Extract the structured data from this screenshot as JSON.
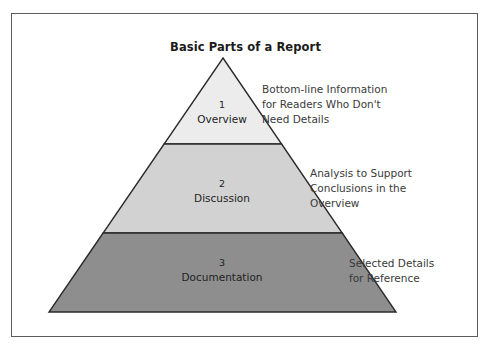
{
  "figure": {
    "title": "Basic Parts of a Report",
    "border_color": "#5c5c5c",
    "background_color": "#ffffff"
  },
  "chart_data": {
    "type": "pyramid",
    "title": "Basic Parts of a Report",
    "levels": [
      {
        "number": "1",
        "name": "Overview",
        "fill": "#ececec",
        "callout": "Bottom-line Information\nfor Readers Who Don't\nNeed Details"
      },
      {
        "number": "2",
        "name": "Discussion",
        "fill": "#d2d2d2",
        "callout": "Analysis to Support\nConclusions in the\nOverview"
      },
      {
        "number": "3",
        "name": "Documentation",
        "fill": "#8e8e8e",
        "callout": "Selected Details\nfor Reference"
      }
    ],
    "geometry": {
      "apex": [
        211,
        44
      ],
      "base_left": [
        37,
        298
      ],
      "base_right": [
        384,
        298
      ],
      "divider_y": [
        130,
        219
      ]
    },
    "outline_color": "#2b2b2b"
  }
}
